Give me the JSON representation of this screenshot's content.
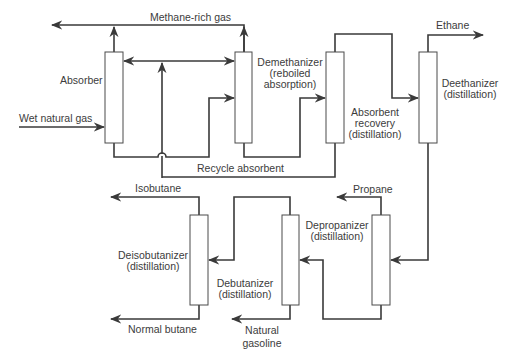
{
  "diagram": {
    "units": [
      {
        "id": "absorber",
        "label": [
          "Absorber"
        ]
      },
      {
        "id": "demethanizer",
        "label": [
          "Demethanizer",
          "(reboiled",
          "absorption)"
        ]
      },
      {
        "id": "absorbent-recovery",
        "label": [
          "Absorbent",
          "recovery",
          "(distillation)"
        ]
      },
      {
        "id": "deethanizer",
        "label": [
          "Deethanizer",
          "(distillation)"
        ]
      },
      {
        "id": "depropanizer",
        "label": [
          "Depropanizer",
          "(distillation)"
        ]
      },
      {
        "id": "debutanizer",
        "label": [
          "Debutanizer",
          "(distillation)"
        ]
      },
      {
        "id": "deisobutanizer",
        "label": [
          "Deisobutanizer",
          "(distillation)"
        ]
      }
    ],
    "streams": {
      "methane": "Methane-rich gas",
      "wet_gas": "Wet natural gas",
      "recycle": "Recycle absorbent",
      "ethane": "Ethane",
      "propane": "Propane",
      "isobutane": "Isobutane",
      "normal_butane": "Normal butane",
      "gasoline": [
        "Natural",
        "gasoline"
      ]
    }
  }
}
